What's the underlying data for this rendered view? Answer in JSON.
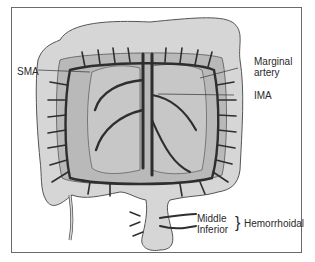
{
  "diagram": {
    "labels": {
      "sma": "SMA",
      "marginal_line1": "Marginal",
      "marginal_line2": "artery",
      "ima": "IMA",
      "middle": "Middle",
      "inferior": "Inferior",
      "hemorrhoidal": "Hemorrhoidal",
      "brace": "}"
    },
    "colors": {
      "colon_fill": "#d6d6d6",
      "mesentery_fill": "#b9b9b9",
      "vessel": "#2e2e2e",
      "outline": "#555555",
      "frame": "#6a6a6a"
    }
  }
}
